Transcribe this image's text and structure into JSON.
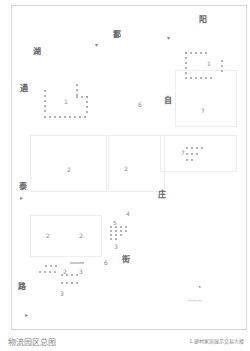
{
  "map": {
    "title": "物流园区总图",
    "legend_note": "1.建材家居展示交易大楼",
    "streets": [
      {
        "id": "north-1",
        "text": "鄱",
        "x": 113,
        "y": 30
      },
      {
        "id": "north-2",
        "text": "阳",
        "x": 199,
        "y": 15
      },
      {
        "id": "west-1",
        "text": "湖",
        "x": 33,
        "y": 47
      },
      {
        "id": "west-2",
        "text": "通",
        "x": 20,
        "y": 84
      },
      {
        "id": "east-1",
        "text": "自",
        "x": 164,
        "y": 96
      },
      {
        "id": "west-3",
        "text": "泰",
        "x": 19,
        "y": 182
      },
      {
        "id": "east-2",
        "text": "庄",
        "x": 158,
        "y": 190
      },
      {
        "id": "south-1",
        "text": "街",
        "x": 122,
        "y": 255
      },
      {
        "id": "west-4",
        "text": "路",
        "x": 18,
        "y": 282
      }
    ],
    "zone_numbers": [
      {
        "text": "1",
        "x": 64,
        "y": 98
      },
      {
        "text": "1",
        "x": 207,
        "y": 60
      },
      {
        "text": "6",
        "x": 138,
        "y": 101
      },
      {
        "text": "7",
        "x": 201,
        "y": 107
      },
      {
        "text": "2",
        "x": 67,
        "y": 166
      },
      {
        "text": "2",
        "x": 124,
        "y": 165
      },
      {
        "text": "7",
        "x": 181,
        "y": 149
      },
      {
        "text": "5",
        "x": 113,
        "y": 219
      },
      {
        "text": "3",
        "x": 114,
        "y": 243
      },
      {
        "text": "2",
        "x": 46,
        "y": 232
      },
      {
        "text": "2",
        "x": 79,
        "y": 232
      },
      {
        "text": "4",
        "x": 126,
        "y": 210
      },
      {
        "text": "2",
        "x": 63,
        "y": 268
      },
      {
        "text": "3",
        "x": 79,
        "y": 268
      },
      {
        "text": "3",
        "x": 60,
        "y": 290
      },
      {
        "text": "6",
        "x": 104,
        "y": 259
      },
      {
        "text": "3",
        "x": 113,
        "y": 244
      }
    ],
    "markers": [
      {
        "text": "▾",
        "x": 95,
        "y": 41
      },
      {
        "text": "▾",
        "x": 167,
        "y": 34
      },
      {
        "text": "▸",
        "x": 20,
        "y": 194
      },
      {
        "text": "▸",
        "x": 25,
        "y": 311
      },
      {
        "text": "•",
        "x": 138,
        "y": 109
      }
    ]
  }
}
